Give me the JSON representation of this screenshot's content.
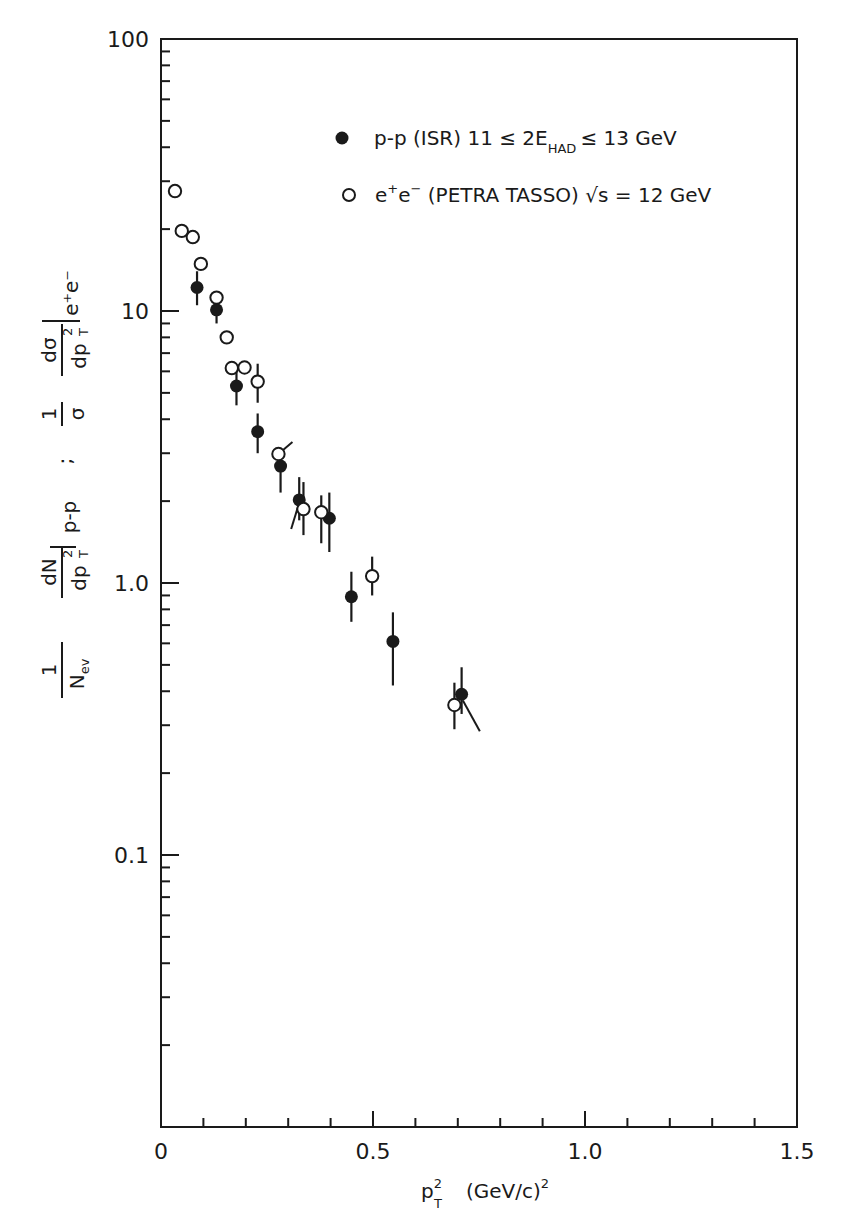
{
  "chart_data": {
    "type": "scatter",
    "title": "",
    "xlabel": "p_T^2 (GeV/c)^2",
    "ylabel": "1/N_ev dN/dp_T^2 |p-p ; 1/σ dσ/dp_T^2 |e+e-",
    "xlim": [
      0,
      1.5
    ],
    "ylim": [
      0.01,
      100
    ],
    "yscale": "log",
    "grid": false,
    "legend_position": "upper right",
    "x_ticks": [
      {
        "value": 0,
        "label": "0"
      },
      {
        "value": 0.5,
        "label": "0.5"
      },
      {
        "value": 1.0,
        "label": "1.0"
      },
      {
        "value": 1.5,
        "label": "1.5"
      }
    ],
    "y_ticks": [
      {
        "value": 100,
        "label": "100"
      },
      {
        "value": 10,
        "label": "10"
      },
      {
        "value": 1,
        "label": "1.0"
      },
      {
        "value": 0.1,
        "label": "0.1"
      }
    ],
    "series": [
      {
        "name": "p-p (ISR) 11 ≤ 2E_HAD ≤ 13 GeV",
        "marker": "filled-circle",
        "points": [
          {
            "x": 0.085,
            "y": 12.2,
            "ylo": 10.5,
            "yhi": 14.0
          },
          {
            "x": 0.131,
            "y": 10.1,
            "ylo": 9.0,
            "yhi": 11.5
          },
          {
            "x": 0.178,
            "y": 5.3,
            "ylo": 4.5,
            "yhi": 6.2
          },
          {
            "x": 0.228,
            "y": 3.6,
            "ylo": 3.0,
            "yhi": 4.2
          },
          {
            "x": 0.282,
            "y": 2.69,
            "ylo": 2.15,
            "yhi": 3.0
          },
          {
            "x": 0.326,
            "y": 2.02,
            "ylo": 1.7,
            "yhi": 2.45
          },
          {
            "x": 0.397,
            "y": 1.73,
            "ylo": 1.3,
            "yhi": 2.15
          },
          {
            "x": 0.449,
            "y": 0.89,
            "ylo": 0.72,
            "yhi": 1.1
          },
          {
            "x": 0.547,
            "y": 0.61,
            "ylo": 0.42,
            "yhi": 0.78
          },
          {
            "x": 0.709,
            "y": 0.39,
            "ylo": 0.33,
            "yhi": 0.49
          }
        ]
      },
      {
        "name": "e+e- (PETRA TASSO) √s = 12 GeV",
        "marker": "open-circle",
        "points": [
          {
            "x": 0.033,
            "y": 27.6
          },
          {
            "x": 0.049,
            "y": 19.7
          },
          {
            "x": 0.075,
            "y": 18.7
          },
          {
            "x": 0.094,
            "y": 14.9
          },
          {
            "x": 0.131,
            "y": 11.2
          },
          {
            "x": 0.155,
            "y": 8.0
          },
          {
            "x": 0.167,
            "y": 6.17
          },
          {
            "x": 0.197,
            "y": 6.2
          },
          {
            "x": 0.228,
            "y": 5.5,
            "ylo": 4.6,
            "yhi": 6.4
          },
          {
            "x": 0.277,
            "y": 2.98
          },
          {
            "x": 0.336,
            "y": 1.87,
            "ylo": 1.5,
            "yhi": 2.35
          },
          {
            "x": 0.378,
            "y": 1.82,
            "ylo": 1.4,
            "yhi": 2.1
          },
          {
            "x": 0.498,
            "y": 1.06,
            "ylo": 0.9,
            "yhi": 1.25
          },
          {
            "x": 0.692,
            "y": 0.356,
            "ylo": 0.29,
            "yhi": 0.43
          }
        ]
      }
    ],
    "slanted_lines": [
      {
        "x1": 0.277,
        "y1": 2.98,
        "x2": 0.31,
        "y2": 3.3
      },
      {
        "x1": 0.325,
        "y1": 1.95,
        "x2": 0.307,
        "y2": 1.58
      },
      {
        "x1": 0.712,
        "y1": 0.37,
        "x2": 0.752,
        "y2": 0.285
      }
    ]
  },
  "legend": {
    "pp_label": "p-p (ISR)  11 ≤ 2E",
    "pp_sub": "HAD",
    "pp_tail": "≤ 13 GeV",
    "ee_label_pre": "e",
    "ee_sup1": "+",
    "ee_mid": "e",
    "ee_sup2": "−",
    "ee_tail": " (PETRA TASSO)  √s = 12 GeV"
  },
  "axes": {
    "x_title_main": "p",
    "x_title_sup": "2",
    "x_title_sub": "T",
    "x_title_rest": "(GeV/c)",
    "x_title_rest_sup": "2",
    "y_title_parts": {
      "one1": "1",
      "nev_main": "N",
      "nev_sub": "ev",
      "dN": "dN",
      "dpT2_1": "dp",
      "pp_sub": "p-p",
      "semicolon": ";",
      "one2": "1",
      "sigma": "σ",
      "dsigma": "dσ",
      "dpT2_2": "dp",
      "ee_sub": "e⁺e⁻"
    }
  }
}
